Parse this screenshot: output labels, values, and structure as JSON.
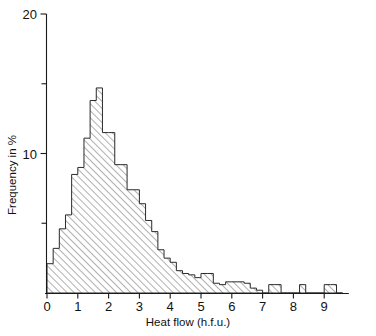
{
  "chart_data": {
    "type": "bar",
    "title": "",
    "subtitle": "",
    "xlabel": "Heat flow (h.f.u.)",
    "ylabel": "Frequency in %",
    "xlim": [
      0,
      9.8
    ],
    "ylim": [
      0,
      20
    ],
    "grid": false,
    "legend": null,
    "bin_width": 0.2,
    "x_ticks": [
      0,
      1,
      2,
      3,
      4,
      5,
      6,
      7,
      8,
      9
    ],
    "x_tick_labels": [
      "0",
      "1",
      "2",
      "3",
      "4",
      "5",
      "6",
      "7",
      "8",
      "9"
    ],
    "x_minor_ticks": [],
    "y_ticks": [
      0,
      10,
      20
    ],
    "y_tick_labels": [
      "0",
      "10",
      "20"
    ],
    "y_minor_ticks": [
      5,
      15
    ],
    "bin_starts": [
      0.0,
      0.2,
      0.4,
      0.6,
      0.8,
      1.0,
      1.2,
      1.4,
      1.6,
      1.8,
      2.0,
      2.2,
      2.4,
      2.6,
      2.8,
      3.0,
      3.2,
      3.4,
      3.6,
      3.8,
      4.0,
      4.2,
      4.4,
      4.6,
      4.8,
      5.0,
      5.2,
      5.4,
      5.6,
      5.8,
      6.0,
      6.2,
      6.4,
      6.6,
      6.8,
      7.0,
      7.2,
      7.4,
      7.6,
      7.8,
      8.0,
      8.2,
      8.4,
      8.6,
      8.8,
      9.0,
      9.2,
      9.4
    ],
    "values": [
      2.1,
      3.2,
      4.6,
      5.6,
      8.5,
      9.0,
      11.1,
      13.8,
      14.7,
      11.5,
      11.5,
      9.2,
      9.2,
      7.4,
      7.4,
      6.4,
      5.2,
      4.4,
      3.1,
      2.5,
      2.2,
      1.6,
      1.4,
      1.3,
      1.1,
      1.4,
      1.4,
      0.7,
      0.6,
      0.8,
      0.8,
      0.8,
      0.7,
      0.35,
      0.2,
      0.0,
      0.6,
      0.6,
      0.0,
      0.0,
      0.0,
      0.6,
      0.0,
      0.0,
      0.0,
      0.6,
      0.6,
      0.0
    ],
    "peak": {
      "x": 1.6,
      "y": 14.7
    },
    "fill_style": "diagonal-hatch",
    "fill_color": "#555555",
    "outline_color": "#2a2a2a",
    "background_color": "#ffffff"
  }
}
